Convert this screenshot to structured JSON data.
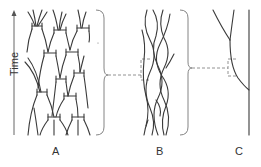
{
  "axis": {
    "label": "Time",
    "direction": "up"
  },
  "panels": [
    {
      "id": "A",
      "label": "A",
      "description": "branching tree with horizontal bars"
    },
    {
      "id": "B",
      "label": "B",
      "description": "braided reticulate lineages"
    },
    {
      "id": "C",
      "label": "C",
      "description": "single lineage with merging branch"
    }
  ],
  "colors": {
    "line": "#3a3a3a",
    "brace": "#777777",
    "background": "#ffffff"
  }
}
